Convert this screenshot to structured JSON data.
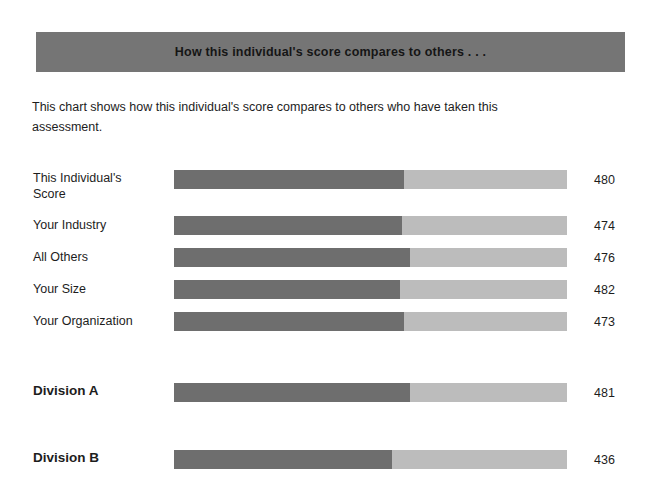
{
  "banner": {
    "title": "How this individual's score compares to others . . ."
  },
  "intro": {
    "text": "This chart shows how this individual's score compares to others who have taken this assessment."
  },
  "colors": {
    "banner_background": "#757575",
    "bar_dark": "#6e6e6e",
    "bar_light": "#bcbcbc",
    "page_background": "#ffffff",
    "text": "#1d1d1d"
  },
  "chart_data": {
    "type": "bar",
    "title": "How this individual's score compares to others . . .",
    "subtitle": "This chart shows how this individual's score compares to others who have taken this assessment.",
    "orientation": "horizontal",
    "xlabel": "",
    "ylabel": "",
    "grid": false,
    "legend": "none",
    "value_labels_position": "right",
    "categories": [
      "This Individual's Score",
      "Your Industry",
      "All Others",
      "Your Size",
      "Your Organization",
      "Division A",
      "Division B"
    ],
    "values": [
      480,
      474,
      476,
      482,
      473,
      481,
      436
    ],
    "series": [
      {
        "name": "Score",
        "values": [
          480,
          474,
          476,
          482,
          473,
          481,
          436
        ]
      }
    ],
    "rows": [
      {
        "label_lines": [
          "This Individual's",
          "Score"
        ],
        "label": "This Individual's Score",
        "value": 480,
        "fill_percent": 58.5,
        "emphasis": false,
        "top": 170,
        "label_top": 170
      },
      {
        "label_lines": [
          "Your Industry"
        ],
        "label": "Your Industry",
        "value": 474,
        "fill_percent": 58.0,
        "emphasis": false,
        "top": 216,
        "label_top": 217
      },
      {
        "label_lines": [
          "All Others"
        ],
        "label": "All Others",
        "value": 476,
        "fill_percent": 60.0,
        "emphasis": false,
        "top": 248,
        "label_top": 249
      },
      {
        "label_lines": [
          "Your Size"
        ],
        "label": "Your Size",
        "value": 482,
        "fill_percent": 57.5,
        "emphasis": false,
        "top": 280,
        "label_top": 281
      },
      {
        "label_lines": [
          "Your Organization"
        ],
        "label": "Your Organization",
        "value": 473,
        "fill_percent": 58.5,
        "emphasis": false,
        "top": 312,
        "label_top": 313
      },
      {
        "label_lines": [
          "Division A"
        ],
        "label": "Division A",
        "value": 481,
        "fill_percent": 60.0,
        "emphasis": true,
        "top": 383,
        "label_top": 383
      },
      {
        "label_lines": [
          "Division B"
        ],
        "label": "Division B",
        "value": 436,
        "fill_percent": 55.5,
        "emphasis": true,
        "top": 450,
        "label_top": 450
      }
    ]
  }
}
